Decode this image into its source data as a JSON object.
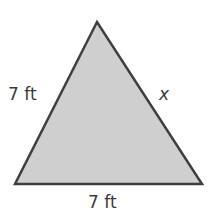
{
  "figure": {
    "shape": "triangle",
    "fill_color": "#cfcfcf",
    "stroke_color": "#3f3f3f",
    "vertices": {
      "apex": [
        97,
        22
      ],
      "bottom_left": [
        15,
        184
      ],
      "bottom_right": [
        202,
        184
      ]
    },
    "labels": {
      "left_side": "7 ft",
      "right_side": "x",
      "base": "7 ft"
    }
  }
}
